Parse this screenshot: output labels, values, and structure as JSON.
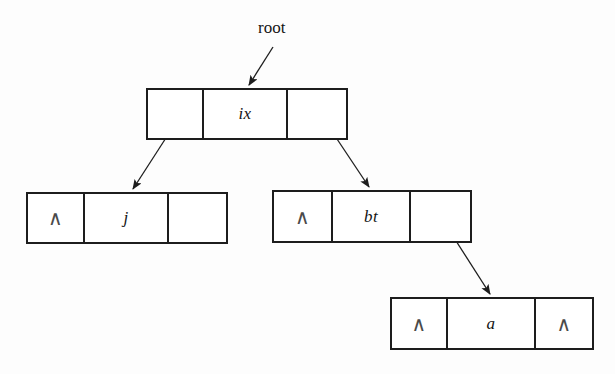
{
  "diagram": {
    "title_label": "root",
    "null_glyph": "∧",
    "ink_color": "#1d1d1d",
    "background_color": "#fdfdfd",
    "nodes": [
      {
        "id": "root-node",
        "value": "ix",
        "left_cell": "",
        "right_cell": "",
        "left_is_null": false,
        "right_is_null": false
      },
      {
        "id": "left-child-node",
        "value": "j",
        "left_cell": "∧",
        "right_cell": "",
        "left_is_null": true,
        "right_is_null": false
      },
      {
        "id": "right-child-node",
        "value": "bt",
        "left_cell": "∧",
        "right_cell": "",
        "left_is_null": true,
        "right_is_null": false
      },
      {
        "id": "leaf-node",
        "value": "a",
        "left_cell": "∧",
        "right_cell": "∧",
        "left_is_null": true,
        "right_is_null": true
      }
    ],
    "edges": [
      {
        "id": "root-pointer-arrow",
        "from": "root-label",
        "to": "root-node"
      },
      {
        "id": "root-left-arrow",
        "from": "root-node",
        "to": "left-child-node"
      },
      {
        "id": "root-right-arrow",
        "from": "root-node",
        "to": "right-child-node"
      },
      {
        "id": "bt-right-arrow",
        "from": "right-child-node",
        "to": "leaf-node"
      }
    ]
  }
}
